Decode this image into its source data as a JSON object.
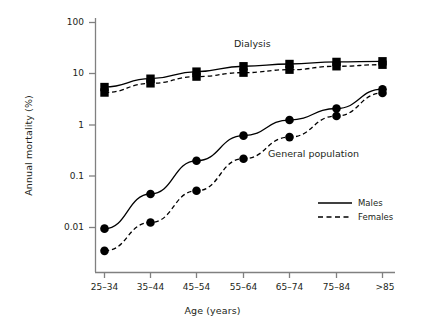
{
  "chart_data": {
    "type": "line",
    "title": "",
    "xlabel": "Age (years)",
    "ylabel": "Annual mortality (%)",
    "categories": [
      "25–34",
      "35–44",
      "45–54",
      "55–64",
      "65–74",
      "75–84",
      ">85"
    ],
    "yscale": "log",
    "ylim": [
      0.0022,
      100
    ],
    "yticks": [
      100,
      10,
      1,
      0.1,
      0.01
    ],
    "ytick_labels": [
      "100",
      "10",
      "1",
      "0.1",
      "0.01"
    ],
    "grid": false,
    "legend_position": "lower-right",
    "series": [
      {
        "name": "Dialysis – Males",
        "group": "Dialysis",
        "sex": "Males",
        "linestyle": "solid",
        "marker": "square",
        "values": [
          5.5,
          8.0,
          11.0,
          14.0,
          15.5,
          17.0,
          17.5
        ]
      },
      {
        "name": "Dialysis – Females",
        "group": "Dialysis",
        "sex": "Females",
        "linestyle": "dashed",
        "marker": "square",
        "values": [
          4.3,
          6.5,
          8.8,
          10.5,
          12.0,
          14.0,
          15.0
        ]
      },
      {
        "name": "General population – Males",
        "group": "General population",
        "sex": "Males",
        "linestyle": "solid",
        "marker": "circle",
        "values": [
          0.0095,
          0.045,
          0.2,
          0.62,
          1.25,
          2.1,
          5.0
        ]
      },
      {
        "name": "General population – Females",
        "group": "General population",
        "sex": "Females",
        "linestyle": "dashed",
        "marker": "circle",
        "values": [
          0.0035,
          0.0125,
          0.052,
          0.22,
          0.58,
          1.5,
          4.2
        ]
      }
    ],
    "annotations": [
      {
        "text": "Dialysis",
        "x_frac": 0.565,
        "y_value": 28
      },
      {
        "text": "General population",
        "x_frac": 0.8,
        "y_value": 0.33
      }
    ],
    "legend": [
      {
        "label": "Males",
        "linestyle": "solid"
      },
      {
        "label": "Females",
        "linestyle": "dashed"
      }
    ],
    "colors": {
      "line": "#000000",
      "axis": "#808080",
      "text": "#231f20",
      "background": "#ffffff"
    }
  }
}
